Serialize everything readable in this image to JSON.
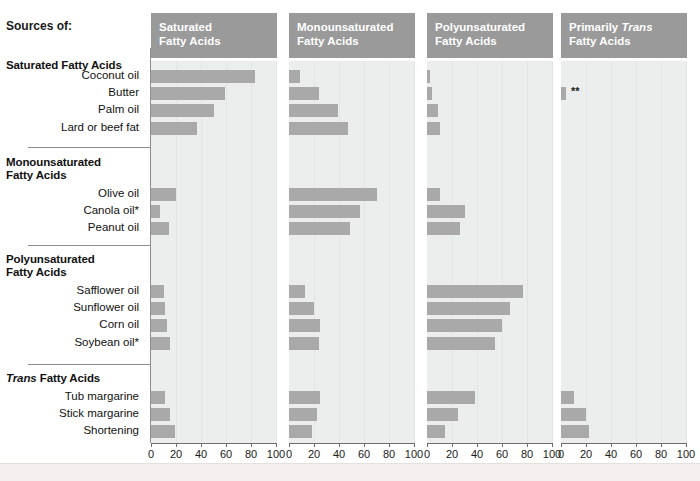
{
  "header": {
    "sources_label": "Sources of:"
  },
  "colors": {
    "panel_header_bg": "#9a9a9a",
    "panel_body_bg": "#eceeee",
    "bar": "#a9a9a9",
    "text": "#1a1a1a",
    "divider": "#8d8d8d"
  },
  "annotations": {
    "trans_double_star": "**"
  },
  "chart_data": {
    "type": "bar",
    "title": "Sources of:",
    "xlabel": "",
    "ylabel": "",
    "xlim": [
      0,
      100
    ],
    "xticks": [
      0,
      20,
      40,
      60,
      80,
      100
    ],
    "xticklabels": [
      "0",
      "20",
      "40",
      "60",
      "80",
      "100"
    ],
    "grid": true,
    "legend": "none",
    "orientation": "horizontal",
    "panels": [
      {
        "label_line1": "Saturated",
        "label_line2": "Fatty Acids",
        "italic_word": ""
      },
      {
        "label_line1": "Monounsaturated",
        "label_line2": "Fatty Acids",
        "italic_word": ""
      },
      {
        "label_line1": "Polyunsaturated",
        "label_line2": "Fatty Acids",
        "italic_word": ""
      },
      {
        "label_line1": "Primarily Trans",
        "label_line2": "Fatty Acids",
        "italic_word": "Trans"
      }
    ],
    "groups": [
      {
        "name": "Saturated Fatty Acids",
        "name_line1": "Saturated Fatty Acids",
        "name_line2": "",
        "italic_word": "",
        "rows": [
          {
            "label": "Coconut oil",
            "values": [
              83,
              9,
              2,
              0
            ]
          },
          {
            "label": "Butter",
            "values": [
              59,
              24,
              4,
              4
            ]
          },
          {
            "label": "Palm oil",
            "values": [
              50,
              39,
              9,
              0
            ]
          },
          {
            "label": "Lard or beef fat",
            "values": [
              37,
              47,
              10,
              0
            ]
          }
        ]
      },
      {
        "name": "Monounsaturated Fatty Acids",
        "name_line1": "Monounsaturated",
        "name_line2": "Fatty Acids",
        "italic_word": "",
        "rows": [
          {
            "label": "Olive oil",
            "values": [
              20,
              70,
              10,
              0
            ]
          },
          {
            "label": "Canola oil*",
            "values": [
              7,
              57,
              30,
              0
            ]
          },
          {
            "label": "Peanut oil",
            "values": [
              14,
              49,
              26,
              0
            ]
          }
        ]
      },
      {
        "name": "Polyunsaturated Fatty Acids",
        "name_line1": "Polyunsaturated",
        "name_line2": "Fatty Acids",
        "italic_word": "",
        "rows": [
          {
            "label": "Safflower oil",
            "values": [
              10,
              13,
              77,
              0
            ]
          },
          {
            "label": "Sunflower oil",
            "values": [
              11,
              20,
              66,
              0
            ]
          },
          {
            "label": "Corn oil",
            "values": [
              13,
              25,
              60,
              0
            ]
          },
          {
            "label": "Soybean oil*",
            "values": [
              15,
              24,
              54,
              0
            ]
          }
        ]
      },
      {
        "name": "Trans Fatty Acids",
        "name_line1": "Trans Fatty Acids",
        "name_line2": "",
        "italic_word": "Trans",
        "rows": [
          {
            "label": "Tub margarine",
            "values": [
              11,
              25,
              38,
              10
            ]
          },
          {
            "label": "Stick margarine",
            "values": [
              15,
              22,
              25,
              20
            ]
          },
          {
            "label": "Shortening",
            "values": [
              19,
              18,
              14,
              22
            ]
          }
        ]
      }
    ]
  }
}
